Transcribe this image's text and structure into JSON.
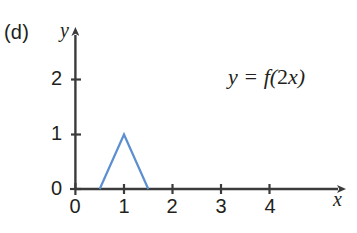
{
  "figure": {
    "part_label": "(d)",
    "equation_lhs": "y",
    "equation_eq": " = ",
    "equation_f": "f",
    "equation_open": "(",
    "equation_coef": "2",
    "equation_var": "x",
    "equation_close": ")",
    "equation_full": "y = f(2x)",
    "y_axis_name": "y",
    "x_axis_name": "x",
    "axis_color": "#3b3b3b",
    "curve_color": "#5b8fd0",
    "text_color": "#231f20",
    "background_color": "#ffffff"
  },
  "chart_data": {
    "type": "line",
    "title": "",
    "annotation": "y = f(2x)",
    "panel_label": "(d)",
    "xlabel": "x",
    "ylabel": "y",
    "xlim": [
      0,
      4.6
    ],
    "ylim": [
      0,
      2.45
    ],
    "xticks": [
      0,
      1,
      2,
      3,
      4
    ],
    "xtick_labels": [
      "0",
      "1",
      "2",
      "3",
      "4"
    ],
    "yticks": [
      0,
      1,
      2
    ],
    "ytick_labels": [
      "0",
      "1",
      "2"
    ],
    "grid": false,
    "legend": null,
    "series": [
      {
        "name": "y = f(2x)",
        "color": "#5b8fd0",
        "x": [
          0.5,
          1.0,
          1.5
        ],
        "y": [
          0,
          1,
          0
        ]
      }
    ]
  }
}
